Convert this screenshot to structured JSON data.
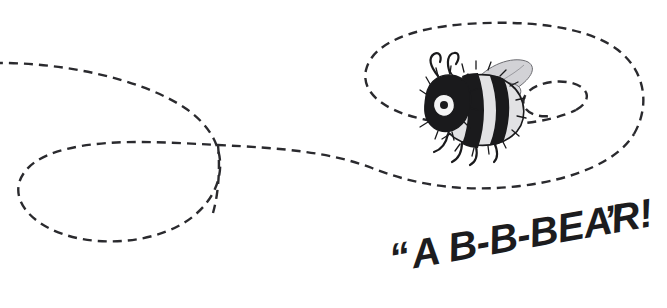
{
  "scene": {
    "title": "Bumblebee flight path illustration",
    "background_color": "#ffffff",
    "width": 667,
    "height": 308
  },
  "flight_path": {
    "name": "dashed-flight-trail",
    "stroke_color": "#2a2a2e",
    "stroke_width": 2.4,
    "dash_pattern": "9 6",
    "description": "Dashed looping trail entering from the left edge, forming a large teardrop loop on the left, crossing itself, then spiraling inward on the right to the bee",
    "segments": [
      {
        "name": "entry-and-left-loop",
        "d": "M -6 63 C 60 62 140 78 185 108 C 232 140 228 186 196 214 C 160 246 86 250 45 226 C 6 203 12 170 48 155 C 92 137 160 142 218 145 C 282 148 330 152 372 168 C 420 187 468 192 520 186 C 578 179 618 160 634 134"
      },
      {
        "name": "crossing-descender",
        "d": "M 218 145 C 220 166 219 192 213 213"
      },
      {
        "name": "outer-spiral-loop",
        "d": "M 634 134 C 650 106 646 72 618 50 C 585 25 524 20 466 24 C 410 28 372 44 366 70 C 360 96 392 116 440 122 C 492 129 548 124 576 110"
      },
      {
        "name": "inner-spiral-hook",
        "d": "M 576 110 C 592 101 590 88 572 83 C 552 78 528 86 524 98 C 520 110 534 118 550 116"
      }
    ]
  },
  "bee": {
    "name": "bumblebee-illustration",
    "style": "pen-and-ink drawing",
    "position": {
      "x": 418,
      "y": 58,
      "width": 118,
      "height": 92
    },
    "body_dark_color": "#1a1a1c",
    "body_light_color": "#dcdcde",
    "wing_color": "#c8c8cc",
    "parts": [
      "head",
      "eye",
      "antennae",
      "thorax",
      "striped-abdomen",
      "wings",
      "legs"
    ]
  },
  "caption": {
    "name": "speech-caption",
    "full_text": "“A B-B-BEAR!”",
    "open_quote": "“",
    "words": "A B-B-BEAR!",
    "close_quote": "”",
    "color": "#1c1c1e",
    "baseline_rotation_deg": -10,
    "style": "bold condensed hand-lettered"
  }
}
